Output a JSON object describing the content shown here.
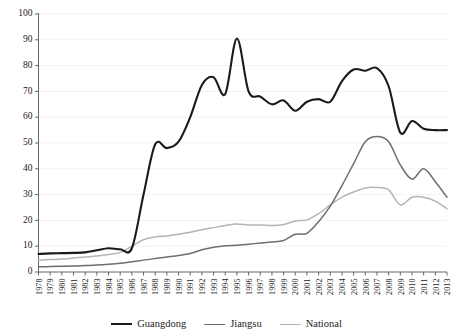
{
  "chart_data": {
    "type": "line",
    "title": "",
    "xlabel": "",
    "ylabel": "",
    "ylim": [
      0,
      100
    ],
    "ytick_step": 10,
    "grid": true,
    "legend_position": "bottom",
    "x": [
      1978,
      1979,
      1980,
      1981,
      1982,
      1983,
      1984,
      1985,
      1986,
      1987,
      1988,
      1989,
      1990,
      1991,
      1992,
      1993,
      1994,
      1995,
      1996,
      1997,
      1998,
      1999,
      2000,
      2001,
      2002,
      2003,
      2004,
      2005,
      2006,
      2007,
      2008,
      2009,
      2010,
      2011,
      2012,
      2013
    ],
    "xtick_labels": [
      "1978",
      "1979",
      "1980",
      "1981",
      "1982",
      "1983",
      "1984",
      "1985",
      "1986",
      "1987",
      "1988",
      "1989",
      "1990",
      "1991",
      "1992",
      "1993",
      "1994",
      "1995",
      "1996",
      "1997",
      "1998",
      "1999",
      "2000",
      "2001",
      "2002",
      "2003",
      "2004",
      "2005",
      "2006",
      "2007",
      "2008",
      "2009",
      "2010",
      "2011",
      "2012",
      "2013"
    ],
    "ytick_labels": [
      "0",
      "10",
      "20",
      "30",
      "40",
      "50",
      "60",
      "70",
      "80",
      "90",
      "100"
    ],
    "series": [
      {
        "name": "Guangdong",
        "color": "#1a1a1a",
        "width": 2.1,
        "values": [
          7.0,
          7.2,
          7.3,
          7.4,
          7.6,
          8.4,
          9.2,
          8.8,
          9.2,
          30.0,
          49.5,
          48.0,
          50.5,
          60.0,
          72.5,
          75.5,
          69.0,
          90.5,
          70.0,
          68.0,
          65.0,
          66.5,
          62.5,
          66.0,
          67.0,
          66.0,
          74.0,
          78.5,
          78.0,
          79.0,
          72.0,
          54.0,
          58.5,
          55.5,
          55.0,
          55.0
        ]
      },
      {
        "name": "Jiangsu",
        "color": "#6e6e6e",
        "width": 1.5,
        "values": [
          2.0,
          2.1,
          2.2,
          2.3,
          2.5,
          2.7,
          3.0,
          3.4,
          4.0,
          4.6,
          5.2,
          5.8,
          6.4,
          7.2,
          8.6,
          9.6,
          10.2,
          10.4,
          10.8,
          11.2,
          11.6,
          12.2,
          14.6,
          15.0,
          19.5,
          25.5,
          33.5,
          42.0,
          50.5,
          52.5,
          50.5,
          41.5,
          36.0,
          40.0,
          35.0,
          29.0
        ]
      },
      {
        "name": "National",
        "color": "#b4b4b4",
        "width": 1.5,
        "values": [
          4.6,
          4.8,
          5.0,
          5.4,
          5.8,
          6.2,
          6.8,
          7.6,
          10.0,
          12.5,
          13.6,
          14.0,
          14.6,
          15.4,
          16.4,
          17.2,
          18.0,
          18.6,
          18.2,
          18.2,
          18.0,
          18.4,
          19.8,
          20.2,
          22.6,
          26.0,
          29.0,
          31.0,
          32.6,
          32.8,
          31.8,
          26.0,
          29.0,
          29.0,
          27.5,
          24.5
        ]
      }
    ]
  },
  "legend": {
    "items": [
      {
        "label": "Guangdong",
        "color": "#1a1a1a",
        "width": 2.2
      },
      {
        "label": "Jiangsu",
        "color": "#6e6e6e",
        "width": 1.5
      },
      {
        "label": "National",
        "color": "#b4b4b4",
        "width": 1.5
      }
    ]
  }
}
